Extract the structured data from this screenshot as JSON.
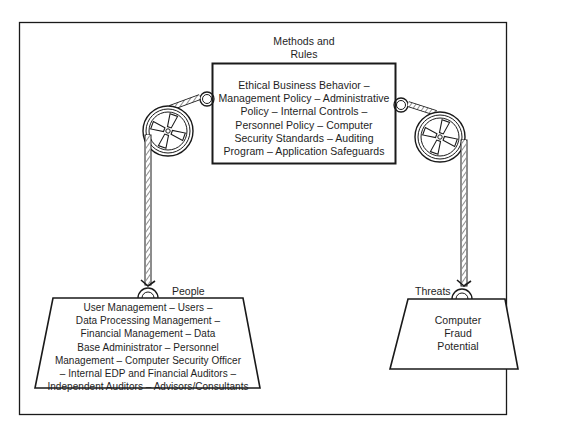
{
  "diagram": {
    "type": "pulley-balance",
    "colors": {
      "ink": "#1a1a1a",
      "background": "#ffffff",
      "rope_hatch": "#555555"
    },
    "methods": {
      "title_lines": [
        "Methods and",
        "Rules"
      ],
      "lines": [
        "Ethical Business Behavior –",
        "Management Policy – Administrative",
        "Policy – Internal Controls –",
        "Personnel Policy – Computer",
        "Security Standards – Auditing",
        "Program – Application Safeguards"
      ]
    },
    "people": {
      "label": "People",
      "lines": [
        "User Management – Users –",
        "Data Processing Management –",
        "Financial Management – Data",
        "Base Administrator – Personnel",
        "Management – Computer Security Officer",
        "– Internal EDP and Financial Auditors –",
        "Independent Auditors – Advisors/Consultants"
      ]
    },
    "threats": {
      "label": "Threats",
      "lines": [
        "Computer",
        "Fraud",
        "Potential"
      ]
    },
    "icons": {
      "left_pulley": "pulley-wheel-icon",
      "right_pulley": "pulley-wheel-icon",
      "left_ring": "ring-hook-icon",
      "right_ring": "ring-hook-icon"
    }
  }
}
